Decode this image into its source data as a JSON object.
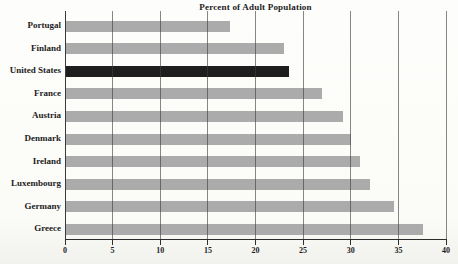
{
  "chart_data": {
    "type": "bar",
    "orientation": "horizontal",
    "title": "Percent of Adult Population",
    "categories": [
      "Portugal",
      "Finland",
      "United States",
      "France",
      "Austria",
      "Denmark",
      "Ireland",
      "Luxembourg",
      "Germany",
      "Greece"
    ],
    "values": [
      17.3,
      23,
      23.5,
      27,
      29.2,
      30,
      31,
      32,
      34.5,
      37.6
    ],
    "highlighted_category": "United States",
    "xlabel": "",
    "ylabel": "",
    "xlim": [
      0,
      40
    ],
    "x_ticks": [
      0,
      5,
      10,
      15,
      20,
      25,
      30,
      35,
      40
    ],
    "grid": "vertical",
    "legend": "none",
    "colors": {
      "bar": "#ababab",
      "highlight_bar": "#1e1e1e",
      "gridline": "#3e3e3e",
      "axis": "#2c2c2c",
      "text": "#1c1c1c",
      "background": "#fbfbf8"
    }
  }
}
